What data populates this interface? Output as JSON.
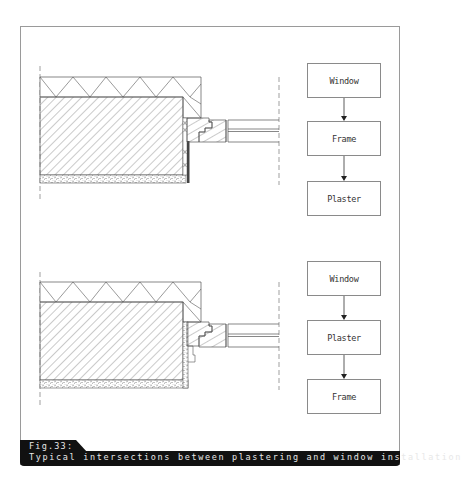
{
  "figure": {
    "number_label": "Fig.33:",
    "caption": "Typical intersections between plastering and window installation"
  },
  "details": [
    {
      "id": "detail-top",
      "description": "Wall section with window frame installed before plastering; plaster runs up to frame",
      "layers": [
        "insulation",
        "masonry",
        "plaster",
        "window-frame",
        "glazing"
      ],
      "flowchart": {
        "steps": [
          "Window",
          "Frame",
          "Plaster"
        ]
      }
    },
    {
      "id": "detail-bottom",
      "description": "Wall section with plaster applied into reveal before frame; frame overlaps plaster",
      "layers": [
        "insulation",
        "masonry",
        "plaster",
        "window-frame",
        "glazing"
      ],
      "flowchart": {
        "steps": [
          "Window",
          "Plaster",
          "Frame"
        ]
      }
    }
  ],
  "colors": {
    "line": "#555555",
    "frame_border": "#9a9a9a",
    "caption_bg": "#111111",
    "caption_text": "#e8e8e8"
  }
}
